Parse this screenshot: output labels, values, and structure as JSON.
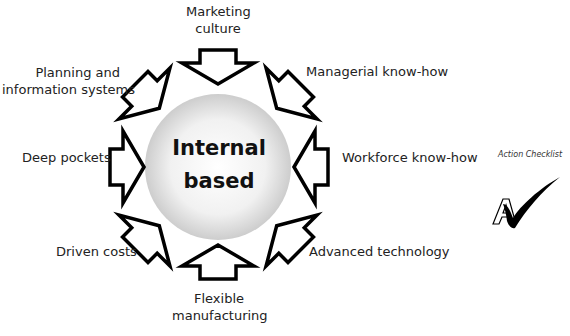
{
  "diagram": {
    "center": {
      "line1": "Internal",
      "line2": "based",
      "fill_light": "#ffffff",
      "fill_dark": "#cfcfcf"
    },
    "factors": [
      {
        "name": "marketing-culture",
        "line1": "Marketing",
        "line2": "culture",
        "angle": 0
      },
      {
        "name": "managerial-know-how",
        "line1": "Managerial know-how",
        "line2": "",
        "angle": 45
      },
      {
        "name": "workforce-know-how",
        "line1": "Workforce know-how",
        "line2": "",
        "angle": 90
      },
      {
        "name": "advanced-technology",
        "line1": "Advanced technology",
        "line2": "",
        "angle": 135
      },
      {
        "name": "flexible-manufacturing",
        "line1": "Flexible",
        "line2": "manufacturing",
        "angle": 180
      },
      {
        "name": "driven-costs",
        "line1": "Driven costs",
        "line2": "",
        "angle": 225
      },
      {
        "name": "deep-pockets",
        "line1": "Deep pockets",
        "line2": "",
        "angle": 270
      },
      {
        "name": "planning-information-systems",
        "line1": "Planning and",
        "line2": "information systems",
        "angle": 315
      }
    ],
    "arrow_stroke": "#000000",
    "arrow_fill": "#ffffff"
  },
  "badge": {
    "caption": "Action Checklist",
    "letter": "A"
  }
}
